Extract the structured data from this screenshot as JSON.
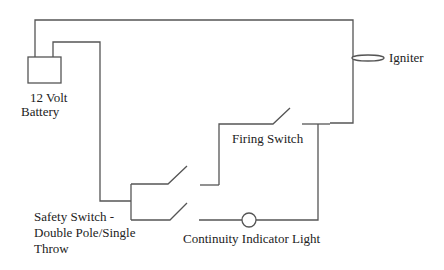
{
  "diagram": {
    "type": "circuit schematic",
    "colors": {
      "wire": "#555555",
      "text": "#222222",
      "background": "#ffffff"
    },
    "components": {
      "battery": {
        "label_line1": "12 Volt",
        "label_line2": "Battery"
      },
      "igniter": {
        "label": "Igniter"
      },
      "firing_switch": {
        "label": "Firing Switch"
      },
      "safety_switch": {
        "label_line1": "Safety Switch -",
        "label_line2": "Double Pole/Single",
        "label_line3": "Throw"
      },
      "indicator_light": {
        "label": "Continuity Indicator Light"
      }
    }
  }
}
